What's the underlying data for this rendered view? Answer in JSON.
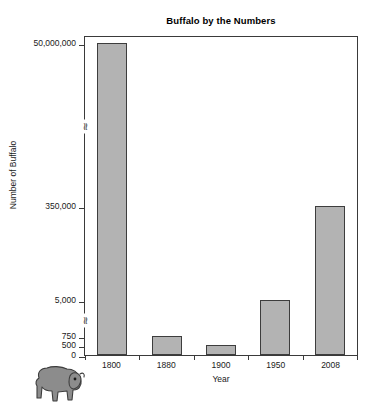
{
  "chart_data": {
    "type": "bar",
    "title": "Buffalo by the Numbers",
    "xlabel": "Year",
    "ylabel": "Number of Buffalo",
    "categories": [
      "1800",
      "1880",
      "1900",
      "1950",
      "2008"
    ],
    "values": [
      50000000,
      750,
      500,
      5000,
      350000
    ],
    "value_labels": [
      "50,000,000",
      "750",
      "500",
      "5,000",
      "350,000"
    ],
    "ytick_labels": [
      "0",
      "500",
      "750",
      "5,000",
      "350,000",
      "50,000,000"
    ],
    "ytick_values": [
      0,
      500,
      750,
      5000,
      350000,
      50000000
    ],
    "axis_breaks": 2,
    "axis_break_symbol": "≈",
    "grid": false,
    "legend": null,
    "bar_color": "#b3b3b3",
    "bar_border_color": "#3d3d3d",
    "axis_color": "#3a3a3a",
    "background_color": "#ffffff",
    "series": [
      {
        "name": "Number of Buffalo",
        "points": [
          {
            "x": "1800",
            "y": 50000000,
            "label": "50,000,000"
          },
          {
            "x": "1880",
            "y": 750,
            "label": "750"
          },
          {
            "x": "1900",
            "y": 500,
            "label": "500"
          },
          {
            "x": "1950",
            "y": 5000,
            "label": "5,000"
          },
          {
            "x": "2008",
            "y": 350000,
            "label": "350,000"
          }
        ]
      }
    ]
  },
  "decoration": {
    "buffalo_icon_name": "buffalo-illustration",
    "buffalo_color": "#8c8c8c",
    "buffalo_outline": "#3d3d3d"
  }
}
